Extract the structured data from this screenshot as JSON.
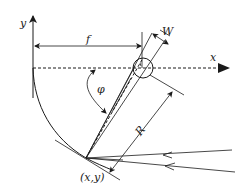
{
  "diagram": {
    "labels": {
      "y_axis": "y",
      "x_axis": "x",
      "focal_length": "f",
      "aperture_width": "W",
      "angle": "φ",
      "radius": "R",
      "point": "(x,y)"
    },
    "colors": {
      "line": "#1a1a1a",
      "background": "#ffffff"
    }
  }
}
